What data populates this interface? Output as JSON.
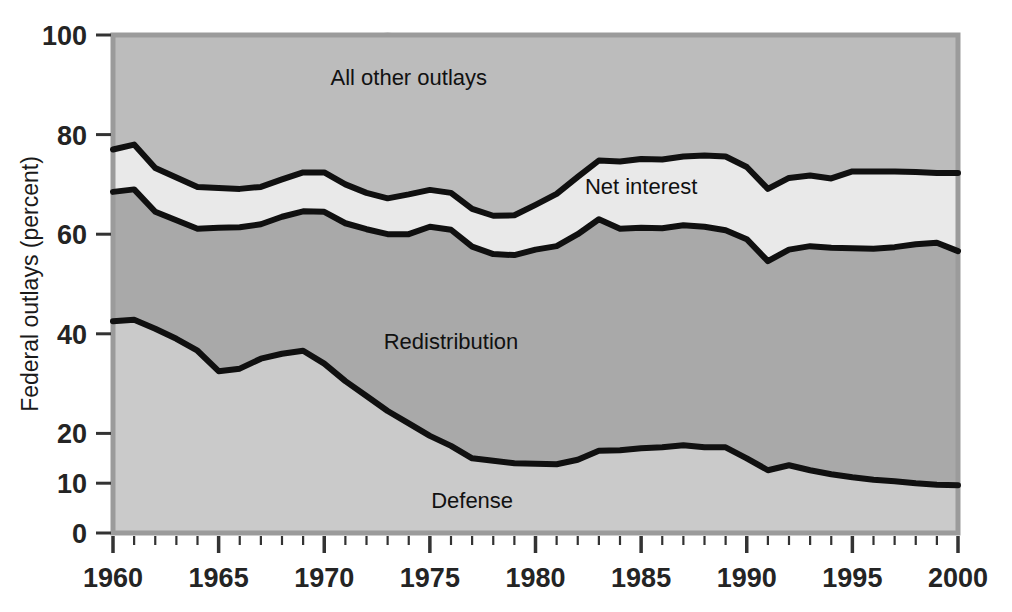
{
  "chart_data": {
    "type": "area",
    "title": "",
    "subtitle": "",
    "xlabel": "",
    "ylabel": "Federal outlays (percent)",
    "xlim": [
      1960,
      2000
    ],
    "ylim": [
      0,
      100
    ],
    "grid": false,
    "legend_position": "inline-annotations",
    "stacked": true,
    "stack_order": "bottom-to-top",
    "x": [
      1960,
      1961,
      1962,
      1963,
      1964,
      1965,
      1966,
      1967,
      1968,
      1969,
      1970,
      1971,
      1972,
      1973,
      1974,
      1975,
      1976,
      1977,
      1978,
      1979,
      1980,
      1981,
      1982,
      1983,
      1984,
      1985,
      1986,
      1987,
      1988,
      1989,
      1990,
      1991,
      1992,
      1993,
      1994,
      1995,
      1996,
      1997,
      1998,
      1999,
      2000
    ],
    "x_tick_labels": [
      "1960",
      "1965",
      "1970",
      "1975",
      "1980",
      "1985",
      "1990",
      "1995",
      "2000"
    ],
    "x_major_ticks": [
      1960,
      1965,
      1970,
      1975,
      1980,
      1985,
      1990,
      1995,
      2000
    ],
    "y_tick_labels": [
      "0",
      "10",
      "20",
      "40",
      "60",
      "80",
      "100"
    ],
    "y_ticks": [
      0,
      10,
      20,
      40,
      60,
      80,
      100
    ],
    "series": [
      {
        "name": "Defense",
        "fill": "#cacaca",
        "label_x": 1977,
        "label_y": 5,
        "values": [
          42.5,
          42.8,
          41.0,
          39.0,
          36.6,
          32.5,
          33.0,
          35.0,
          36.0,
          36.6,
          34.0,
          30.5,
          27.5,
          24.5,
          22.0,
          19.5,
          17.5,
          15.0,
          14.5,
          14.0,
          13.9,
          13.8,
          14.7,
          16.5,
          16.6,
          17.0,
          17.2,
          17.6,
          17.2,
          17.2,
          15.0,
          12.6,
          13.6,
          12.6,
          11.8,
          11.2,
          10.7,
          10.4,
          10.0,
          9.7,
          9.6
        ]
      },
      {
        "name": "Redistribution",
        "fill": "#a9a9a9",
        "label_x": 1976,
        "label_y": 37,
        "values": [
          26.0,
          26.2,
          23.5,
          23.8,
          24.5,
          28.8,
          28.4,
          27.0,
          27.5,
          28.0,
          30.5,
          31.7,
          33.5,
          35.5,
          38.0,
          42.0,
          43.4,
          42.5,
          41.5,
          41.8,
          43.0,
          43.8,
          45.3,
          46.5,
          44.5,
          44.3,
          44.0,
          44.2,
          44.3,
          43.6,
          44.0,
          42.0,
          43.3,
          45.0,
          45.5,
          46.0,
          46.4,
          47.0,
          48.0,
          48.6,
          47.0
        ]
      },
      {
        "name": "Net interest",
        "fill": "#e9e9e9",
        "label_x": 1985,
        "label_y": 68,
        "values": [
          8.5,
          9.0,
          8.8,
          8.6,
          8.4,
          8.0,
          7.7,
          7.5,
          7.5,
          7.8,
          7.9,
          7.8,
          7.3,
          7.2,
          8.0,
          7.4,
          7.4,
          7.6,
          7.7,
          8.0,
          9.0,
          10.5,
          11.5,
          11.8,
          13.5,
          13.8,
          13.8,
          13.8,
          14.3,
          14.8,
          14.5,
          14.5,
          14.4,
          14.2,
          13.9,
          15.4,
          15.5,
          15.2,
          14.5,
          14.0,
          15.7
        ]
      },
      {
        "name": "All other outlays",
        "fill": "#bcbcbc",
        "label_x": 1974,
        "label_y": 90,
        "values": [
          23.0,
          22.0,
          26.7,
          28.6,
          30.5,
          30.7,
          30.9,
          30.5,
          29.0,
          27.6,
          27.6,
          30.0,
          31.7,
          33.3,
          32.0,
          31.1,
          31.7,
          34.9,
          36.3,
          36.2,
          34.1,
          31.9,
          28.5,
          25.2,
          25.4,
          24.9,
          25.0,
          24.4,
          24.2,
          24.4,
          26.5,
          30.9,
          28.7,
          28.2,
          28.8,
          27.4,
          27.4,
          27.4,
          27.5,
          27.7,
          27.7
        ]
      }
    ]
  },
  "axis": {
    "y_title": "Federal outlays (percent)"
  },
  "annotations": {
    "all_other_outlays": "All other outlays",
    "net_interest": "Net interest",
    "redistribution": "Redistribution",
    "defense": "Defense"
  },
  "colors": {
    "defense_fill": "#cacaca",
    "redistribution_fill": "#a9a9a9",
    "net_interest_fill": "#e9e9e9",
    "all_other_fill": "#bcbcbc",
    "boundary_line": "#101010",
    "plot_border": "#9b9b9b",
    "text": "#1a1a1a",
    "background": "#ffffff"
  }
}
